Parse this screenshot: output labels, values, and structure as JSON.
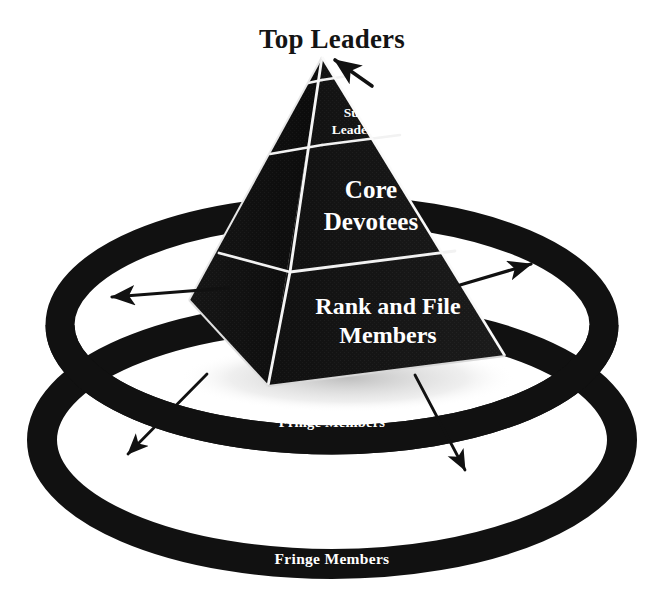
{
  "diagram": {
    "title": "Top Leaders",
    "type": "cult-organizational-pyramid",
    "background_color": "#ffffff",
    "ink_color": "#111111",
    "label_color": "#ffffff",
    "pyramid": {
      "name": "hierarchy-pyramid",
      "levels": [
        {
          "id": "top-leaders",
          "label": "Top Leaders",
          "label_placement": "external-above-apex",
          "order": 1
        },
        {
          "id": "sub-leaders",
          "label_lines": [
            "Sub",
            "Leaders"
          ],
          "label": "Sub Leaders",
          "label_placement": "inside",
          "order": 2
        },
        {
          "id": "core-devotees",
          "label_lines": [
            "Core",
            "Devotees"
          ],
          "label": "Core Devotees",
          "label_placement": "inside",
          "order": 3
        },
        {
          "id": "rank-and-file",
          "label_lines": [
            "Rank and File",
            "Members"
          ],
          "label": "Rank and File Members",
          "label_placement": "inside",
          "order": 4
        }
      ]
    },
    "rings": [
      {
        "id": "inner-ring",
        "label": "Fringe Members",
        "order": 1
      },
      {
        "id": "outer-ring",
        "label": "Fringe Members",
        "order": 2
      }
    ],
    "arrows": [
      {
        "id": "arrow-to-apex",
        "direction": "down-left",
        "points_to": "top-leaders"
      },
      {
        "id": "arrow-left-outward",
        "direction": "left",
        "points_to": "inner-ring"
      },
      {
        "id": "arrow-right-outward",
        "direction": "right",
        "points_to": "inner-ring"
      },
      {
        "id": "arrow-left-down",
        "direction": "down-left",
        "points_to": "outer-ring"
      },
      {
        "id": "arrow-right-down",
        "direction": "down-right",
        "points_to": "outer-ring"
      }
    ]
  }
}
